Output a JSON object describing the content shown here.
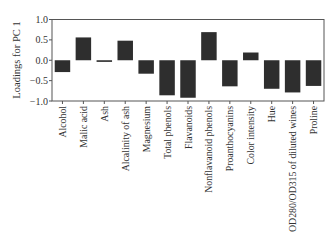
{
  "chart_data": {
    "type": "bar",
    "title": "",
    "xlabel": "",
    "ylabel": "Loadings for PC 1",
    "ylim": [
      -1.0,
      1.0
    ],
    "yticks": [
      1.0,
      0.5,
      0.0,
      -0.5,
      -1.0
    ],
    "ytick_labels": [
      "1.0",
      "0.5",
      "0.0",
      "−0.5",
      "−1.0"
    ],
    "grid": false,
    "legend": null,
    "bar_color": "#2e2e2e",
    "categories": [
      "Alcohol",
      "Malic acid",
      "Ash",
      "Alcalinity of ash",
      "Magnesium",
      "Total phenols",
      "Flavanoids",
      "Nonflavanoid phenols",
      "Proanthocyanins",
      "Color intensity",
      "Hue",
      "OD280/OD315 of diluted wines",
      "Proline"
    ],
    "values": [
      -0.29,
      0.56,
      -0.04,
      0.48,
      -0.33,
      -0.86,
      -0.92,
      0.69,
      -0.64,
      0.19,
      -0.7,
      -0.79,
      -0.63
    ]
  }
}
